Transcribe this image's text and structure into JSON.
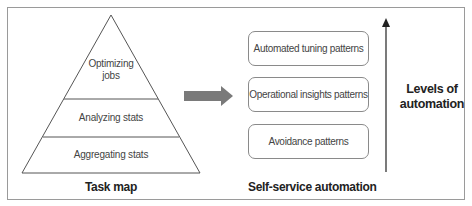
{
  "task_map": {
    "title": "Task map",
    "levels": [
      {
        "label_line1": "Optimizing",
        "label_line2": "jobs"
      },
      {
        "label": "Analyzing stats"
      },
      {
        "label": "Aggregating stats"
      }
    ]
  },
  "transition_arrow": {
    "icon": "right-arrow-icon",
    "color": "#7a7a7a"
  },
  "self_service": {
    "title": "Self-service automation",
    "patterns": [
      {
        "label": "Automated tuning patterns"
      },
      {
        "label": "Operational insights patterns"
      },
      {
        "label": "Avoidance patterns"
      }
    ]
  },
  "automation_axis": {
    "label_line1": "Levels of",
    "label_line2": "automation",
    "icon": "up-arrow-icon"
  },
  "colors": {
    "frame_border": "#9a9a9a",
    "line": "#555555",
    "arrow_fill": "#7a7a7a"
  }
}
